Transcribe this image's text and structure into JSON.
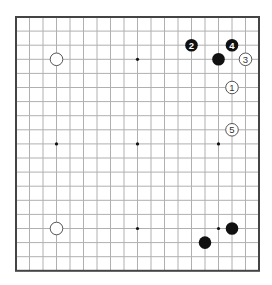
{
  "board": {
    "size": 19,
    "origin_x": 16,
    "origin_y": 17,
    "spacing_x": 13.5,
    "spacing_y": 14.1,
    "stone_radius": 6.3,
    "colors": {
      "background": "#ffffff",
      "border": "#444444",
      "grid_line": "#b0b0b0",
      "star_point": "#111111",
      "black_stone": "#111111",
      "white_stone_fill": "#ffffff",
      "white_stone_outline": "#555555"
    },
    "star_points": [
      {
        "col": 3,
        "row": 3
      },
      {
        "col": 9,
        "row": 3
      },
      {
        "col": 15,
        "row": 3
      },
      {
        "col": 3,
        "row": 9
      },
      {
        "col": 9,
        "row": 9
      },
      {
        "col": 15,
        "row": 9
      },
      {
        "col": 3,
        "row": 15
      },
      {
        "col": 9,
        "row": 15
      },
      {
        "col": 15,
        "row": 15
      }
    ],
    "stones": [
      {
        "color": "white",
        "col": 3,
        "row": 3,
        "label": ""
      },
      {
        "color": "white",
        "col": 3,
        "row": 15,
        "label": ""
      },
      {
        "color": "black",
        "col": 15,
        "row": 3,
        "label": ""
      },
      {
        "color": "black",
        "col": 16,
        "row": 15,
        "label": ""
      },
      {
        "color": "black",
        "col": 14,
        "row": 16,
        "label": ""
      },
      {
        "color": "white",
        "col": 16,
        "row": 5,
        "label": "1"
      },
      {
        "color": "black",
        "col": 13,
        "row": 2,
        "label": "2"
      },
      {
        "color": "white",
        "col": 17,
        "row": 3,
        "label": "3"
      },
      {
        "color": "black",
        "col": 16,
        "row": 2,
        "label": "4"
      },
      {
        "color": "white",
        "col": 16,
        "row": 8,
        "label": "5"
      }
    ]
  }
}
